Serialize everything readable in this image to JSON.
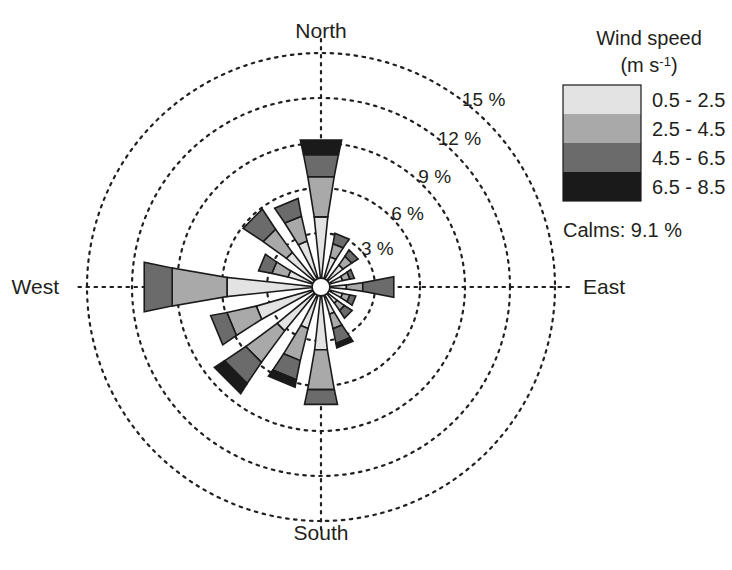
{
  "figure": {
    "type": "wind-rose",
    "background": "#ffffff",
    "center": {
      "x": 321,
      "y": 287
    },
    "hub_radius": 9,
    "px_per_percent": 15
  },
  "compass": {
    "north": "North",
    "east": "East",
    "south": "South",
    "west": "West"
  },
  "radial_axis": {
    "unit": "%",
    "label_suffix": " %",
    "ticks": [
      3,
      6,
      9,
      12,
      15
    ],
    "tick_labels": [
      "3 %",
      "6 %",
      "9 %",
      "12 %",
      "15 %"
    ],
    "grid": "dotted",
    "grid_color": "#231f20"
  },
  "legend": {
    "title_line1": "Wind speed",
    "title_line2_pre": "(m s",
    "title_line2_sup": "-1",
    "title_line2_post": ")",
    "title_line2": "(m s-1)",
    "items": [
      {
        "label": "0.5 - 2.5",
        "color": "#e3e3e3"
      },
      {
        "label": "2.5 - 4.5",
        "color": "#a9a9a9"
      },
      {
        "label": "4.5 - 6.5",
        "color": "#6b6b6b"
      },
      {
        "label": "6.5 - 8.5",
        "color": "#1a1a1a"
      }
    ],
    "calms_label": "Calms: 9.1 %",
    "calms_value": 9.1
  },
  "chart_data": {
    "type": "bar",
    "subtype": "wind-rose-stacked-polar",
    "title": "",
    "xlabel": "",
    "ylabel": "%",
    "ylim": [
      0,
      15
    ],
    "grid": true,
    "legend_position": "right",
    "categories": [
      "N",
      "NNE",
      "NE",
      "ENE",
      "E",
      "ESE",
      "SE",
      "SSE",
      "S",
      "SSW",
      "SW",
      "WSW",
      "W",
      "WNW",
      "NW",
      "NNW"
    ],
    "category_angles_deg": [
      0,
      22.5,
      45,
      67.5,
      90,
      112.5,
      135,
      157.5,
      180,
      202.5,
      225,
      247.5,
      270,
      292.5,
      315,
      337.5
    ],
    "series": [
      {
        "name": "0.5 - 2.5",
        "color": "#e3e3e3",
        "values": [
          4.1,
          1.5,
          1.3,
          0.9,
          1.1,
          0.9,
          0.8,
          1.3,
          3.6,
          2.3,
          3.2,
          3.9,
          5.7,
          1.7,
          2.4,
          2.6
        ]
      },
      {
        "name": "2.5 - 4.5",
        "color": "#a9a9a9",
        "values": [
          2.7,
          0.9,
          0.7,
          0.5,
          1.1,
          0.5,
          0.6,
          1.0,
          2.7,
          2.2,
          2.6,
          2.0,
          3.7,
          1.1,
          1.9,
          1.7
        ]
      },
      {
        "name": "4.5 - 6.5",
        "color": "#6b6b6b",
        "values": [
          1.5,
          0.7,
          0.5,
          0.3,
          2.1,
          0.4,
          0.6,
          1.0,
          1.0,
          1.3,
          1.7,
          1.1,
          1.9,
          0.9,
          1.6,
          1.2
        ]
      },
      {
        "name": "6.5 - 8.5",
        "color": "#1a1a1a",
        "values": [
          1.0,
          0.0,
          0.0,
          0.0,
          0.0,
          0.0,
          0.0,
          0.3,
          0.0,
          0.5,
          0.8,
          0.0,
          0.0,
          0.0,
          0.0,
          0.0
        ]
      }
    ],
    "totals": [
      9.3,
      3.1,
      2.5,
      1.7,
      4.3,
      1.8,
      2.0,
      3.6,
      7.3,
      6.3,
      8.3,
      7.0,
      11.3,
      3.7,
      5.9,
      5.5
    ],
    "calms_percent": 9.1,
    "annotations": [
      "3 %",
      "6 %",
      "9 %",
      "12 %",
      "15 %"
    ]
  }
}
